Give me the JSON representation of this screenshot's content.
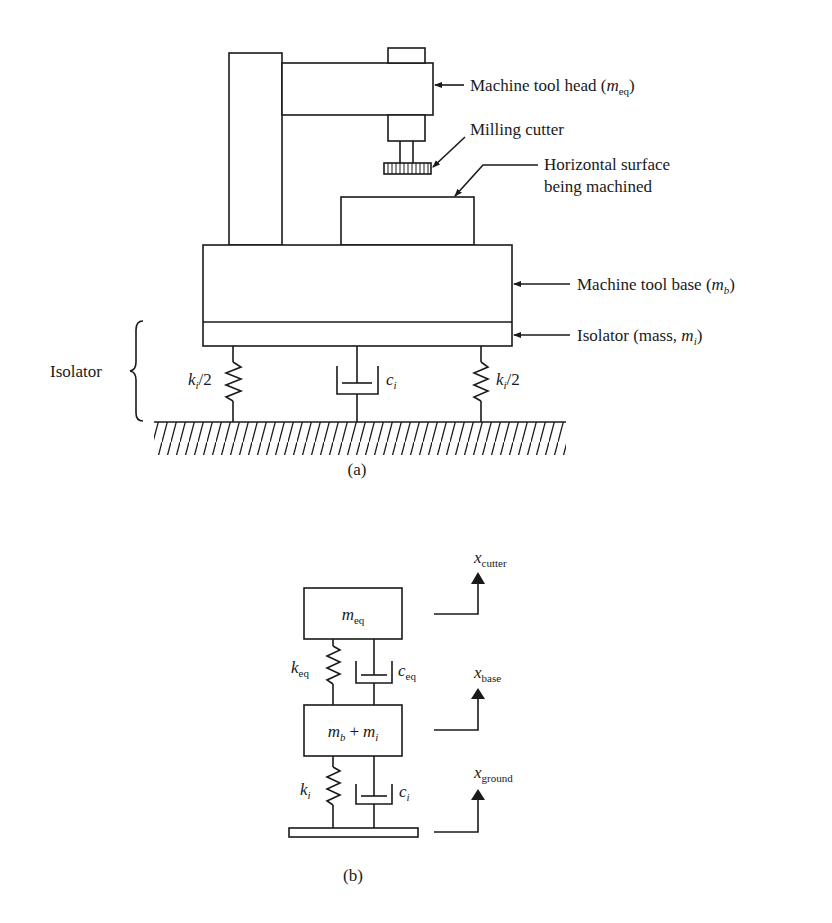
{
  "figure": {
    "part_a": {
      "caption": "(a)",
      "labels": {
        "head": {
          "text": "Machine tool head (",
          "sym": "m",
          "sub": "eq",
          "close": ")"
        },
        "cutter": {
          "text": "Milling cutter"
        },
        "surface_line1": {
          "text": "Horizontal surface"
        },
        "surface_line2": {
          "text": "being machined"
        },
        "base": {
          "text": "Machine tool base (",
          "sym": "m",
          "sub": "b",
          "close": ")"
        },
        "isolator_mass": {
          "text": "Isolator (mass, ",
          "sym": "m",
          "sub": "i",
          "close": ")"
        },
        "isolator_brace": {
          "text": "Isolator"
        },
        "spring_left": {
          "sym": "k",
          "sub": "i",
          "rest": "/2"
        },
        "spring_right": {
          "sym": "k",
          "sub": "i",
          "rest": "/2"
        },
        "damper": {
          "sym": "c",
          "sub": "i"
        }
      }
    },
    "part_b": {
      "caption": "(b)",
      "masses": {
        "top": {
          "sym": "m",
          "sub": "eq"
        },
        "middle": {
          "sym1": "m",
          "sub1": "b",
          "plus": "+",
          "sym2": "m",
          "sub2": "i"
        }
      },
      "elements": {
        "spring_upper": {
          "sym": "k",
          "sub": "eq"
        },
        "damper_upper": {
          "sym": "c",
          "sub": "eq"
        },
        "spring_lower": {
          "sym": "k",
          "sub": "i"
        },
        "damper_lower": {
          "sym": "c",
          "sub": "i"
        }
      },
      "coordinates": {
        "cutter": {
          "sym": "x",
          "sub": "cutter"
        },
        "base": {
          "sym": "x",
          "sub": "base"
        },
        "ground": {
          "sym": "x",
          "sub": "ground"
        }
      }
    }
  }
}
